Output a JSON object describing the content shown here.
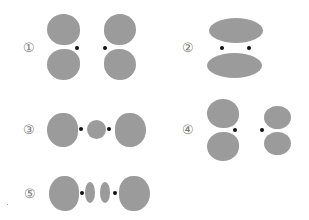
{
  "figures": [
    {
      "label": "①",
      "description": "two p-orbitals side by side, lobes vertical (pi bonding)"
    },
    {
      "label": "②",
      "description": "merged pi bonding orbital, elongated lobes above and below"
    },
    {
      "label": "③",
      "description": "sigma-type orbital with central lobe between nuclei"
    },
    {
      "label": "④",
      "description": "two p-orbitals side by side, unequal sizes"
    },
    {
      "label": "⑤",
      "description": "sigma orbital with two small central lobes between nuclei"
    }
  ],
  "colors": {
    "lobe": "#9b9b9b",
    "nucleus": "#111111",
    "label": "#777777"
  }
}
